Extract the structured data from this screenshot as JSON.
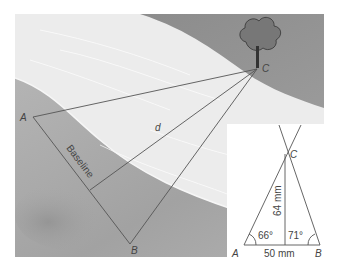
{
  "scene": {
    "description": "Triangulation across a river to a tree",
    "points": {
      "A": {
        "label": "A"
      },
      "B": {
        "label": "B"
      },
      "C": {
        "label": "C"
      }
    },
    "distance_label": "d",
    "baseline_label": "Baseline"
  },
  "inset": {
    "points": {
      "A": "A",
      "B": "B",
      "C": "C"
    },
    "angle_A": "66°",
    "angle_B": "71°",
    "base_length": "50 mm",
    "height_length": "64 mm"
  },
  "colors": {
    "river": "#ececec",
    "bank": "#a9a9a9",
    "bank_dark": "#8f8f8f",
    "line": "#555555",
    "inset_bg": "#ffffff"
  }
}
